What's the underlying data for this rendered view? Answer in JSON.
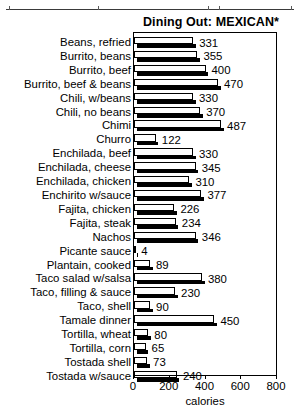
{
  "chart_data": {
    "type": "bar",
    "orientation": "horizontal",
    "title": "Dining Out: MEXICAN*",
    "xlabel": "calories",
    "ylabel": "",
    "xlim": [
      0,
      800
    ],
    "xticks": [
      0,
      200,
      400,
      600,
      800
    ],
    "grid": false,
    "legend": null,
    "categories": [
      "Beans, refried",
      "Burrito, beans",
      "Burrito, beef",
      "Burrito, beef & beans",
      "Chili, w/beans",
      "Chili, no beans",
      "Chimi",
      "Churro",
      "Enchilada, beef",
      "Enchilada, cheese",
      "Enchilada, chicken",
      "Enchirito w/sauce",
      "Fajita, chicken",
      "Fajita, steak",
      "Nachos",
      "Picante sauce",
      "Plantain, cooked",
      "Taco salad w/salsa",
      "Taco, filling & sauce",
      "Taco, shell",
      "Tamale dinner",
      "Tortilla, wheat",
      "Tortilla, corn",
      "Tostada shell",
      "Tostada w/sauce"
    ],
    "values": [
      331,
      355,
      400,
      470,
      330,
      370,
      487,
      122,
      330,
      345,
      310,
      377,
      226,
      234,
      346,
      4,
      89,
      380,
      230,
      90,
      450,
      80,
      65,
      73,
      240
    ]
  },
  "colors": {
    "bar_fill": "#ffffff",
    "bar_outline": "#000000",
    "bar_shadow": "#000000",
    "text": "#000000",
    "background": "#ffffff"
  }
}
